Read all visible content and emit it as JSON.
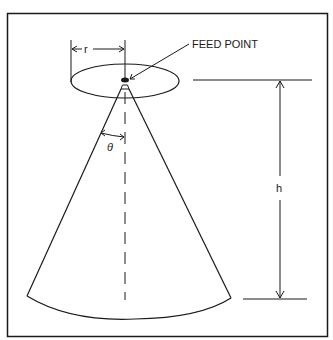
{
  "diagram": {
    "type": "conical antenna geometry",
    "labels": {
      "radius": "r",
      "feed_point": "FEED POINT",
      "angle": "θ",
      "height": "h"
    },
    "colors": {
      "stroke": "#1a1a1a",
      "background": "#ffffff"
    }
  }
}
